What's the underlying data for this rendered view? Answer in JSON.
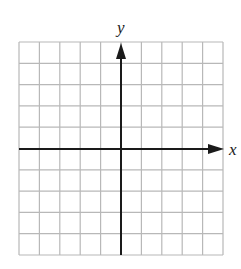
{
  "diagram": {
    "type": "coordinate-plane",
    "x_label": "x",
    "y_label": "y",
    "grid": {
      "columns": 10,
      "rows": 10,
      "line_color": "#b8b8b8"
    },
    "axis_color": "#1a1a1a",
    "origin_cell": {
      "col": 5,
      "row": 5
    }
  }
}
